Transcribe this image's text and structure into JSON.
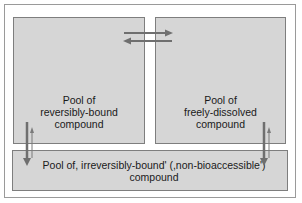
{
  "diagram": {
    "boxes": {
      "reversibly_bound": {
        "lines": [
          "Pool of",
          "reversibly-bound",
          "compound"
        ]
      },
      "freely_dissolved": {
        "lines": [
          "Pool of",
          "freely-dissolved",
          "compound"
        ]
      },
      "irreversibly_bound": {
        "lines": [
          "Pool of, irreversibly-bound' (,non-bioaccessible')",
          "compound"
        ]
      }
    },
    "arrows": [
      {
        "from": "reversibly_bound",
        "to": "freely_dissolved",
        "direction": "right"
      },
      {
        "from": "freely_dissolved",
        "to": "reversibly_bound",
        "direction": "left"
      },
      {
        "from": "reversibly_bound",
        "to": "irreversibly_bound",
        "direction": "down",
        "weight": "thick"
      },
      {
        "from": "irreversibly_bound",
        "to": "reversibly_bound",
        "direction": "up",
        "weight": "thin"
      },
      {
        "from": "freely_dissolved",
        "to": "irreversibly_bound",
        "direction": "down",
        "weight": "thick"
      },
      {
        "from": "irreversibly_bound",
        "to": "freely_dissolved",
        "direction": "up",
        "weight": "thin"
      }
    ],
    "colors": {
      "box_fill": "#d6d6d6",
      "box_border": "#7e7e7e",
      "arrow": "#6f6f6f",
      "frame_border": "#9a9a9a"
    }
  }
}
